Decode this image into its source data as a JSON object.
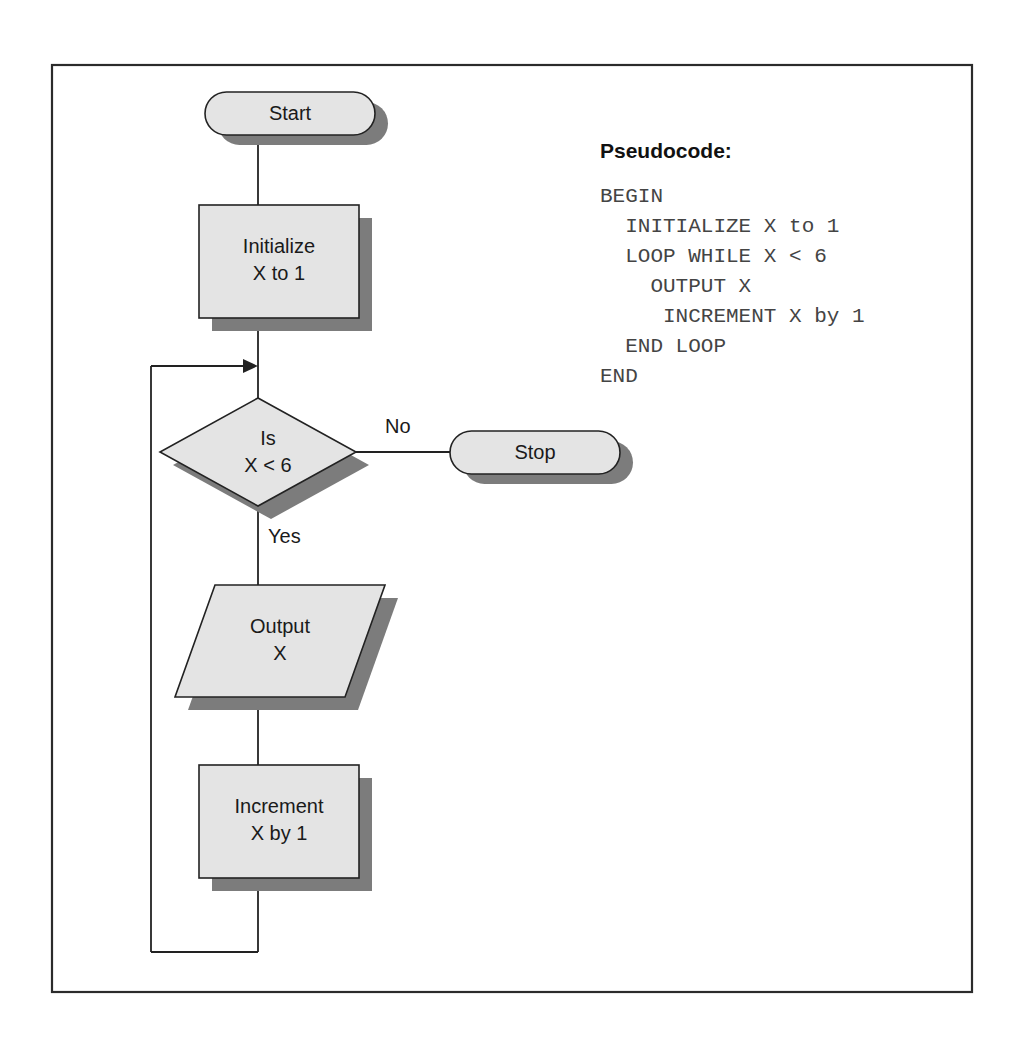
{
  "figure": {
    "kind": "flowchart",
    "background_color": "#ffffff",
    "frame": {
      "stroke": "#2b2b2b",
      "x": 52,
      "y": 65,
      "width": 920,
      "height": 927
    },
    "palette": {
      "shape_fill": "#e4e4e4",
      "shape_stroke": "#222222",
      "shadow": "#7c7c7c",
      "line": "#222222",
      "text": "#1a1a1a",
      "code_text": "#444444"
    }
  },
  "nodes": [
    {
      "id": "start",
      "type": "terminator",
      "label": "Start",
      "lines": [
        "Start"
      ]
    },
    {
      "id": "initialize",
      "type": "process",
      "label": "Initialize X to 1",
      "lines": [
        "Initialize",
        "X to 1"
      ]
    },
    {
      "id": "decision",
      "type": "decision",
      "label": "Is X < 6",
      "lines": [
        "Is",
        "X < 6"
      ]
    },
    {
      "id": "stop",
      "type": "terminator",
      "label": "Stop",
      "lines": [
        "Stop"
      ]
    },
    {
      "id": "output",
      "type": "input-output",
      "label": "Output X",
      "lines": [
        "Output",
        "X"
      ]
    },
    {
      "id": "increment",
      "type": "process",
      "label": "Increment X by 1",
      "lines": [
        "Increment",
        "X by 1"
      ]
    }
  ],
  "edge_labels": {
    "no": "No",
    "yes": "Yes"
  },
  "pseudocode": {
    "title": "Pseudocode:",
    "lines": [
      "BEGIN",
      "  INITIALIZE X to 1",
      "  LOOP WHILE X < 6",
      "    OUTPUT X",
      "     INCREMENT X by 1",
      "  END LOOP",
      "END"
    ]
  }
}
